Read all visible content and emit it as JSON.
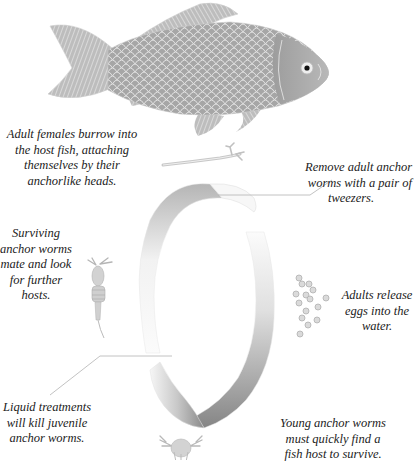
{
  "diagram": {
    "host": {
      "label_icon": "goldfish-illustration"
    },
    "stages": [
      {
        "id": "adult-female",
        "icon": "adult-anchor-worm-icon",
        "caption": "Adult females burrow into the host fish, attaching themselves by their anchorlike heads."
      },
      {
        "id": "eggs",
        "icon": "eggs-icon",
        "caption": "Adults release eggs into the water."
      },
      {
        "id": "juvenile",
        "icon": "larva-icon",
        "caption": "Young anchor worms must quickly find a fish host to survive."
      },
      {
        "id": "surviving",
        "icon": "copepod-icon",
        "caption": "Surviving anchor worms mate and look for further hosts."
      }
    ],
    "treatments": [
      {
        "id": "tweezers",
        "caption": "Remove adult anchor worms with a pair of tweezers."
      },
      {
        "id": "liquid",
        "caption": "Liquid treatments will kill juvenile anchor worms."
      }
    ]
  },
  "captions": {
    "adult_female_l1": "Adult females burrow into",
    "adult_female_l2": "the host fish, attaching",
    "adult_female_l3": "themselves by their",
    "adult_female_l4": "anchorlike heads.",
    "tweezers_l1": "Remove adult anchor",
    "tweezers_l2": "worms with a pair of",
    "tweezers_l3": "tweezers.",
    "surviving_l1": "Surviving",
    "surviving_l2": "anchor worms",
    "surviving_l3": "mate and look",
    "surviving_l4": "for further",
    "surviving_l5": "hosts.",
    "eggs_l1": "Adults release",
    "eggs_l2": "eggs into the",
    "eggs_l3": "water.",
    "liquid_l1": "Liquid treatments",
    "liquid_l2": "will kill juvenile",
    "liquid_l3": "anchor worms.",
    "young_l1": "Young anchor worms",
    "young_l2": "must quickly find a",
    "young_l3": "fish host to survive."
  },
  "colors": {
    "ink": "#222222",
    "fish_body": "#a9a9a9",
    "fish_scale": "#d9d9d9",
    "ribbon_dark": "#8c8c8c",
    "ribbon_light": "#f4f4f4",
    "leader_line": "#9a9a9a"
  }
}
